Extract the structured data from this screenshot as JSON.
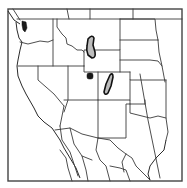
{
  "map": {
    "title": "Range map of western North America",
    "region": "Western United States and northern Mexico",
    "colors": {
      "background": "#ffffff",
      "frame": "#444444",
      "borders": "#3a3a3a",
      "range_fill": "#bdbdbd",
      "range_outline": "#111111",
      "point_fill": "#1a1a1a"
    },
    "features": [
      {
        "type": "range-polygon",
        "label": "Range area - Idaho/Montana/Wyoming border",
        "fill": "gray"
      },
      {
        "type": "range-polygon",
        "label": "Range area - Colorado",
        "fill": "gray"
      },
      {
        "type": "point",
        "label": "Isolated occurrence - northeastern Utah",
        "fill": "black"
      },
      {
        "type": "point",
        "label": "Occurrence - Puget Sound, Washington",
        "fill": "black"
      }
    ]
  }
}
